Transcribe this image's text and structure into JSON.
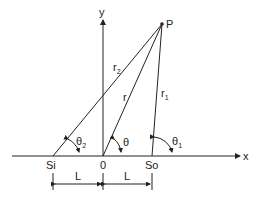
{
  "diagram": {
    "axes": {
      "x_label": "x",
      "y_label": "y",
      "origin_label": "0"
    },
    "point": {
      "label": "P"
    },
    "sources": {
      "left": "Si",
      "right": "So"
    },
    "distances": {
      "r": "r",
      "r1_base": "r",
      "r1_sub": "1",
      "r2_base": "r",
      "r2_sub": "2"
    },
    "angles": {
      "theta": "θ",
      "theta1_base": "θ",
      "theta1_sub": "1",
      "theta2_base": "θ",
      "theta2_sub": "2"
    },
    "spacing": {
      "left": "L",
      "right": "L"
    },
    "colors": {
      "line": "#222222",
      "background": "#ffffff"
    }
  }
}
